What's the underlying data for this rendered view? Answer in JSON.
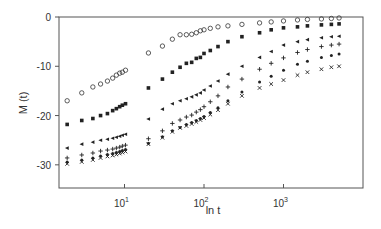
{
  "chart_data": {
    "type": "scatter",
    "title": "",
    "xlabel": "ln t",
    "ylabel": "M (t)",
    "xscale": "log",
    "xlim": [
      1.5,
      10000
    ],
    "ylim": [
      -34.7,
      0
    ],
    "grid": false,
    "legend": null,
    "x_ticks": [
      {
        "value": 10,
        "base": "10",
        "exp": "1"
      },
      {
        "value": 100,
        "base": "10",
        "exp": "2"
      },
      {
        "value": 1000,
        "base": "10",
        "exp": "3"
      }
    ],
    "y_ticks": [
      0,
      -10,
      -20,
      -30
    ],
    "series": [
      {
        "name": "series-1",
        "marker": "open-circle",
        "x": [
          1.9,
          2.9,
          4.0,
          5.0,
          6.1,
          7.1,
          7.9,
          8.7,
          9.4,
          10.3,
          20,
          30,
          40,
          50,
          60,
          70,
          80,
          90,
          100,
          120,
          150,
          200,
          300,
          500,
          700,
          1000,
          1500,
          2000,
          3000,
          4000,
          5000
        ],
        "y": [
          -17.0,
          -15.4,
          -14.2,
          -13.6,
          -13.0,
          -12.4,
          -11.8,
          -11.4,
          -11.2,
          -10.8,
          -7.3,
          -5.9,
          -4.5,
          -3.6,
          -3.6,
          -3.5,
          -3.2,
          -2.8,
          -2.6,
          -2.3,
          -2.0,
          -1.8,
          -1.5,
          -1.2,
          -1.0,
          -0.8,
          -0.6,
          -0.5,
          -0.4,
          -0.3,
          -0.2
        ]
      },
      {
        "name": "series-2",
        "marker": "filled-square",
        "x": [
          1.9,
          2.9,
          4.0,
          5.0,
          6.1,
          7.1,
          7.9,
          8.7,
          9.4,
          10.3,
          20,
          30,
          40,
          50,
          60,
          70,
          80,
          90,
          100,
          120,
          150,
          200,
          300,
          500,
          700,
          1000,
          1500,
          2000,
          3000,
          4000,
          5000
        ],
        "y": [
          -21.8,
          -21.0,
          -20.6,
          -20.0,
          -19.6,
          -19.0,
          -18.6,
          -18.2,
          -17.9,
          -17.6,
          -14.4,
          -12.6,
          -11.2,
          -10.2,
          -9.4,
          -9.2,
          -8.4,
          -8.2,
          -7.4,
          -6.8,
          -6.0,
          -5.0,
          -4.0,
          -3.2,
          -2.6,
          -2.2,
          -2.0,
          -1.8,
          -1.6,
          -1.5,
          -1.4
        ]
      },
      {
        "name": "series-3",
        "marker": "filled-triangle-left",
        "x": [
          1.9,
          2.9,
          4.0,
          5.0,
          6.1,
          7.1,
          7.9,
          8.7,
          9.4,
          10.3,
          20,
          30,
          40,
          50,
          60,
          70,
          80,
          90,
          100,
          120,
          150,
          200,
          300,
          500,
          700,
          1000,
          1500,
          2000,
          3000,
          4000,
          5000
        ],
        "y": [
          -26.6,
          -25.8,
          -25.4,
          -25.0,
          -24.8,
          -24.6,
          -24.4,
          -24.2,
          -24.0,
          -23.8,
          -20.7,
          -18.7,
          -17.6,
          -17.0,
          -16.6,
          -16.2,
          -15.8,
          -15.4,
          -14.8,
          -14.0,
          -13.0,
          -11.6,
          -10.0,
          -8.2,
          -7.0,
          -5.7,
          -5.0,
          -4.6,
          -4.2,
          -4.0,
          -3.9
        ]
      },
      {
        "name": "series-4",
        "marker": "plus",
        "x": [
          1.9,
          2.9,
          4.0,
          5.0,
          6.1,
          7.1,
          7.9,
          8.7,
          9.4,
          10.3,
          20,
          30,
          40,
          50,
          60,
          70,
          80,
          90,
          100,
          120,
          150,
          200,
          300,
          500,
          700,
          1000,
          1500,
          2000,
          3000,
          4000,
          5000
        ],
        "y": [
          -28.6,
          -28.0,
          -27.6,
          -27.2,
          -27.0,
          -26.8,
          -26.6,
          -26.4,
          -26.2,
          -26.0,
          -24.7,
          -23.1,
          -21.6,
          -20.9,
          -20.3,
          -19.9,
          -19.3,
          -18.8,
          -18.2,
          -17.2,
          -16.0,
          -14.2,
          -12.6,
          -10.6,
          -9.4,
          -8.3,
          -7.2,
          -6.6,
          -6.0,
          -5.7,
          -5.5
        ]
      },
      {
        "name": "series-5",
        "marker": "filled-dot",
        "x": [
          1.9,
          2.9,
          4.0,
          5.0,
          6.1,
          7.1,
          7.9,
          8.7,
          9.4,
          10.3,
          20,
          30,
          40,
          50,
          60,
          70,
          80,
          90,
          100,
          120,
          150,
          200,
          300,
          500,
          700,
          1000,
          1500,
          2000,
          3000,
          4000,
          5000
        ],
        "y": [
          -29.4,
          -29.0,
          -28.6,
          -28.2,
          -27.9,
          -27.7,
          -27.5,
          -27.3,
          -27.1,
          -26.9,
          -25.6,
          -24.3,
          -23.1,
          -22.4,
          -21.8,
          -21.4,
          -21.0,
          -20.6,
          -20.2,
          -19.4,
          -18.4,
          -17.0,
          -15.2,
          -13.2,
          -12.0,
          -10.8,
          -9.6,
          -9.0,
          -8.2,
          -7.8,
          -7.5
        ]
      },
      {
        "name": "series-6",
        "marker": "x",
        "x": [
          1.9,
          2.9,
          4.0,
          5.0,
          6.1,
          7.1,
          7.9,
          8.7,
          9.4,
          10.3,
          20,
          30,
          40,
          50,
          60,
          70,
          80,
          90,
          100,
          120,
          150,
          200,
          300,
          500,
          700,
          1000,
          1500,
          2000,
          3000,
          4000,
          5000
        ],
        "y": [
          -29.8,
          -29.4,
          -29.0,
          -28.6,
          -28.3,
          -28.1,
          -27.9,
          -27.7,
          -27.5,
          -27.3,
          -25.8,
          -24.5,
          -23.3,
          -22.5,
          -22.1,
          -21.7,
          -21.3,
          -20.9,
          -20.5,
          -19.8,
          -18.9,
          -17.6,
          -16.0,
          -14.4,
          -13.6,
          -12.8,
          -11.8,
          -11.2,
          -10.6,
          -10.2,
          -10.0
        ]
      }
    ]
  }
}
